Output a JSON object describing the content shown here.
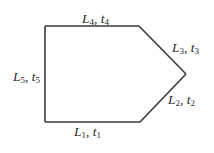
{
  "diagram": {
    "type": "polygon",
    "stroke_color": "#3a3a3a",
    "stroke_width": 1.6,
    "vertices": {
      "top_left": [
        45,
        26
      ],
      "top_right": [
        139,
        26
      ],
      "right_tip": [
        186,
        74
      ],
      "bottom_right": [
        140,
        122
      ],
      "bottom_left": [
        45,
        122
      ]
    },
    "edges": [
      {
        "id": "edge1",
        "position": "bottom",
        "L": "L",
        "L_sub": "1",
        "t": "t",
        "t_sub": "1"
      },
      {
        "id": "edge2",
        "position": "lower-right",
        "L": "L",
        "L_sub": "2",
        "t": "t",
        "t_sub": "2"
      },
      {
        "id": "edge3",
        "position": "upper-right",
        "L": "L",
        "L_sub": "3",
        "t": "t",
        "t_sub": "3"
      },
      {
        "id": "edge4",
        "position": "top",
        "L": "L",
        "L_sub": "4",
        "t": "t",
        "t_sub": "4"
      },
      {
        "id": "edge5",
        "position": "left",
        "L": "L",
        "L_sub": "5",
        "t": "t",
        "t_sub": "5"
      }
    ],
    "separator": ", "
  }
}
